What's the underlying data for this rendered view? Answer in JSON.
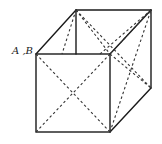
{
  "figure": {
    "vertex_label": "A ,B",
    "colors": {
      "background": "#ffffff",
      "line": "#1a1a1a"
    },
    "vertices": {
      "front_top_left": [
        36,
        54
      ],
      "front_top_right": [
        110,
        54
      ],
      "front_bottom_left": [
        36,
        132
      ],
      "front_bottom_right": [
        110,
        132
      ],
      "back_top_left": [
        76,
        10
      ],
      "back_top_right": [
        151,
        10
      ],
      "back_bottom_right": [
        151,
        88
      ]
    }
  }
}
